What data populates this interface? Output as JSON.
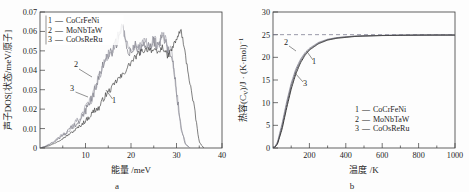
{
  "figure": {
    "panels": [
      {
        "id": "a",
        "caption": "a",
        "xlabel": "能量 /meV",
        "ylabel": "声子DOS[状态/meV/原子]",
        "xticks": [
          "10",
          "20",
          "30",
          "40"
        ],
        "xtick_values": [
          10,
          20,
          30,
          40
        ],
        "yticks": [
          "0",
          "0.01",
          "0.02",
          "0.03",
          "0.04",
          "0.05",
          "0.06",
          "0.07"
        ],
        "ytick_values": [
          0,
          0.01,
          0.02,
          0.03,
          0.04,
          0.05,
          0.06,
          0.07
        ],
        "legend": [
          {
            "num": "1",
            "dash": "—",
            "label": "CoCrFeNi"
          },
          {
            "num": "2",
            "dash": "—",
            "label": "MoNbTaW"
          },
          {
            "num": "3",
            "dash": "—",
            "label": "CoOsReRu"
          }
        ],
        "annotations": [
          {
            "text": "1"
          },
          {
            "text": "2"
          },
          {
            "text": "3"
          }
        ]
      },
      {
        "id": "b",
        "caption": "b",
        "xlabel": "温度 /K",
        "ylabel_main": "热容(C",
        "ylabel_sub": "V",
        "ylabel_tail": ")/J · (K·mol)",
        "ylabel_sup": "−1",
        "xticks": [
          "200",
          "400",
          "600",
          "800",
          "1000"
        ],
        "xtick_values": [
          200,
          400,
          600,
          800,
          1000
        ],
        "yticks": [
          "0",
          "5",
          "10",
          "15",
          "20",
          "25",
          "30"
        ],
        "ytick_values": [
          0,
          5,
          10,
          15,
          20,
          25,
          30
        ],
        "legend": [
          {
            "num": "1",
            "dash": "—",
            "label": "CoCrFeNi"
          },
          {
            "num": "2",
            "dash": "—",
            "label": "MoNbTaW"
          },
          {
            "num": "3",
            "dash": "—",
            "label": "CoOsReRu"
          }
        ],
        "annotations": [
          {
            "text": "1"
          },
          {
            "text": "2"
          },
          {
            "text": "3"
          }
        ],
        "dulong_petit": 25
      }
    ]
  },
  "colors": {
    "curve1": "#3b3b3b",
    "curve2": "#9a9aa6",
    "curve3": "#6f6f7a",
    "dashed": "#7d7d93",
    "axis": "#3a3a3a"
  },
  "chart_data": [
    {
      "type": "line",
      "panel": "a",
      "title": "",
      "xlabel": "能量 /meV",
      "ylabel": "声子DOS[状态/meV/原子]",
      "xlim": [
        0,
        40
      ],
      "ylim": [
        0,
        0.07
      ],
      "grid": false,
      "legend_position": "top-left",
      "xtick_labels": [
        "10",
        "20",
        "30",
        "40"
      ],
      "ytick_labels": [
        "0",
        "0.01",
        "0.02",
        "0.03",
        "0.04",
        "0.05",
        "0.06",
        "0.07"
      ],
      "series": [
        {
          "name": "CoCrFeNi",
          "number": "1",
          "color": "#3b3b3b",
          "x": [
            0,
            1,
            2,
            3,
            4,
            5,
            6,
            7,
            8,
            9,
            10,
            11,
            12,
            13,
            14,
            15,
            16,
            17,
            18,
            19,
            20,
            21,
            22,
            23,
            24,
            25,
            26,
            27,
            28,
            29,
            30,
            31,
            32,
            33,
            34,
            35,
            36
          ],
          "values": [
            0,
            0.0005,
            0.0012,
            0.0022,
            0.0035,
            0.0049,
            0.0064,
            0.008,
            0.0098,
            0.0118,
            0.014,
            0.0165,
            0.0196,
            0.0205,
            0.0258,
            0.0288,
            0.0315,
            0.0352,
            0.037,
            0.0406,
            0.044,
            0.0468,
            0.0492,
            0.0505,
            0.0512,
            0.0498,
            0.049,
            0.0522,
            0.047,
            0.051,
            0.056,
            0.0608,
            0.047,
            0.033,
            0.019,
            0.003,
            0
          ]
        },
        {
          "name": "MoNbTaW",
          "number": "2",
          "color": "#9a9aa6",
          "x": [
            0,
            1,
            2,
            3,
            4,
            5,
            6,
            7,
            8,
            9,
            10,
            11,
            12,
            13,
            14,
            15,
            16,
            17,
            18,
            19,
            20,
            21,
            22,
            23,
            24,
            25,
            26,
            27,
            28,
            29,
            30,
            31,
            32,
            33
          ],
          "values": [
            0,
            0.0008,
            0.002,
            0.0034,
            0.005,
            0.0068,
            0.0087,
            0.0107,
            0.0131,
            0.016,
            0.0196,
            0.024,
            0.03,
            0.0372,
            0.044,
            0.0478,
            0.0512,
            0.056,
            0.0642,
            0.053,
            0.0498,
            0.053,
            0.0512,
            0.0545,
            0.052,
            0.0556,
            0.053,
            0.059,
            0.052,
            0.049,
            0.03,
            0.01,
            0.002,
            0
          ]
        },
        {
          "name": "CoOsReRu",
          "number": "3",
          "color": "#6f6f7a",
          "x": [
            0,
            1,
            2,
            3,
            4,
            5,
            6,
            7,
            8,
            9,
            10,
            11,
            12,
            13,
            14,
            15,
            16,
            17,
            18,
            19,
            20,
            21,
            22,
            23,
            24,
            25,
            26,
            27,
            28,
            29,
            30,
            31,
            32,
            33
          ],
          "values": [
            0,
            0.0007,
            0.0018,
            0.0031,
            0.0046,
            0.0063,
            0.0082,
            0.0102,
            0.0126,
            0.0156,
            0.019,
            0.0234,
            0.0294,
            0.0366,
            0.0432,
            0.047,
            0.0505,
            0.0552,
            0.063,
            0.052,
            0.0492,
            0.0524,
            0.0505,
            0.0538,
            0.0514,
            0.0548,
            0.0524,
            0.0582,
            0.0514,
            0.0484,
            0.0296,
            0.0098,
            0.0018,
            0
          ]
        }
      ]
    },
    {
      "type": "line",
      "panel": "b",
      "title": "",
      "xlabel": "温度 /K",
      "ylabel": "热容(Cv)/J · (K·mol)−1",
      "xlim": [
        0,
        1000
      ],
      "ylim": [
        0,
        30
      ],
      "grid": false,
      "legend_position": "bottom-right",
      "xtick_labels": [
        "200",
        "400",
        "600",
        "800",
        "1000"
      ],
      "ytick_labels": [
        "0",
        "5",
        "10",
        "15",
        "20",
        "25",
        "30"
      ],
      "reference_line": {
        "y": 25,
        "style": "dashed",
        "label": ""
      },
      "series": [
        {
          "name": "CoCrFeNi",
          "number": "1",
          "color": "#3b3b3b",
          "x": [
            10,
            25,
            50,
            75,
            100,
            125,
            150,
            175,
            200,
            250,
            300,
            350,
            400,
            450,
            500,
            600,
            700,
            800,
            900,
            1000
          ],
          "values": [
            0.15,
            0.9,
            4.2,
            8.8,
            13.0,
            16.3,
            18.7,
            20.4,
            21.6,
            23.0,
            23.8,
            24.2,
            24.4,
            24.6,
            24.7,
            24.8,
            24.85,
            24.9,
            24.9,
            24.9
          ]
        },
        {
          "name": "MoNbTaW",
          "number": "2",
          "color": "#9a9aa6",
          "x": [
            10,
            25,
            50,
            75,
            100,
            125,
            150,
            175,
            200,
            250,
            300,
            350,
            400,
            450,
            500,
            600,
            700,
            800,
            900,
            1000
          ],
          "values": [
            0.25,
            1.4,
            5.4,
            10.2,
            14.3,
            17.4,
            19.5,
            21.0,
            22.0,
            23.3,
            24.0,
            24.35,
            24.55,
            24.7,
            24.75,
            24.85,
            24.9,
            24.9,
            24.95,
            24.95
          ]
        },
        {
          "name": "CoOsReRu",
          "number": "3",
          "color": "#6f6f7a",
          "x": [
            10,
            25,
            50,
            75,
            100,
            125,
            150,
            175,
            200,
            250,
            300,
            350,
            400,
            450,
            500,
            600,
            700,
            800,
            900,
            1000
          ],
          "values": [
            0.2,
            1.1,
            4.8,
            9.5,
            13.7,
            16.9,
            19.1,
            20.7,
            21.8,
            23.15,
            23.9,
            24.3,
            24.5,
            24.65,
            24.72,
            24.82,
            24.88,
            24.9,
            24.92,
            24.92
          ]
        }
      ]
    }
  ]
}
